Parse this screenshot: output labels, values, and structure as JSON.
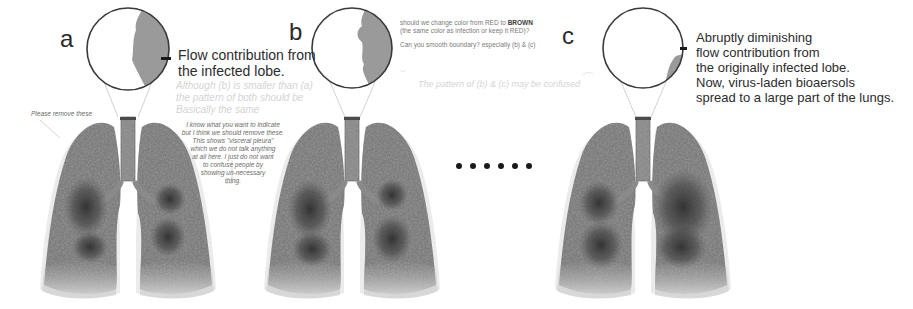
{
  "figure": {
    "panels": [
      {
        "label": "a",
        "caption_lines": [
          "Flow contribution from",
          "the infected lobe."
        ],
        "faint_comment_lines": [
          "Although (b) is smaller than (a)",
          "the pattern of both should be",
          "Basically the same"
        ],
        "review_notes": {
          "left": "Please remove these",
          "right_lines": [
            "I know what you want to indicate",
            "but I think we should remove these.",
            "This shows \"visceral pleura\"",
            "which we do not talk anything",
            "at all here. I just do not want",
            "to confuse people by",
            "showing un-necessary",
            "thing."
          ]
        },
        "infected_area": "large"
      },
      {
        "label": "b",
        "review_notes": {
          "line1_pre": "should we change color from RED to ",
          "line1_bold": "BROWN",
          "line2": "(the same color as infection or keep it RED)?",
          "line3": "Can you smooth boundary? especially (b) & (c)",
          "faint_line": "The pattern of (b) & (c) may be confused"
        },
        "infected_area": "medium"
      },
      {
        "label": "c",
        "caption_lines": [
          "Abruptly diminishing",
          "flow contribution from",
          "the originally infected lobe.",
          "Now, virus-laden bioaersols",
          "spread to a large part of the lungs."
        ],
        "infected_area": "thin"
      }
    ],
    "ellipsis_dot_count": 6,
    "colors": {
      "circle_stroke": "#3a3a3a",
      "infected_fill": "#9a9a9a",
      "lung_mid": "#7c7c7c",
      "lung_dark": "#3c3c3c",
      "lung_light": "#c8c8c8"
    }
  }
}
